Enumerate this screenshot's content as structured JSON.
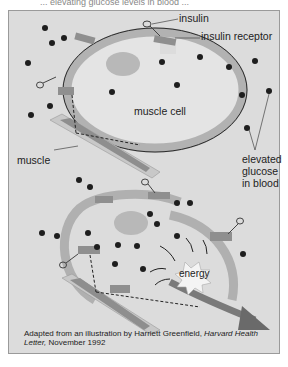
{
  "top_text": "... elevating glucose levels in blood ...",
  "labels": {
    "insulin": "insulin",
    "insulin_receptor": "insulin receptor",
    "muscle_cell": "muscle cell",
    "muscle": "muscle",
    "elevated_glucose_1": "elevated",
    "elevated_glucose_2": "glucose",
    "elevated_glucose_3": "in blood",
    "energy": "energy"
  },
  "caption": {
    "prefix": "Adapted from an illustration by Harriett Greenfield, ",
    "italic_1": "Harvard Health",
    "italic_2": "Letter,",
    "suffix": " November 1992"
  },
  "colors": {
    "background": "#dcdcdc",
    "membrane_light": "#b4b4b4",
    "membrane_dark": "#8c8c8c",
    "nucleus": "#b8b8b8",
    "glucose": "#1e1e1e",
    "arrow": "#777777"
  }
}
